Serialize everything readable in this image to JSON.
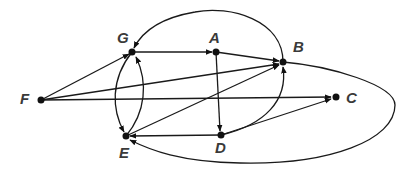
{
  "diagram": {
    "type": "directed-graph",
    "nodes": [
      {
        "id": "A",
        "label": "A",
        "x": 216,
        "y": 52
      },
      {
        "id": "B",
        "label": "B",
        "x": 283,
        "y": 62
      },
      {
        "id": "C",
        "label": "C",
        "x": 336,
        "y": 97
      },
      {
        "id": "D",
        "label": "D",
        "x": 221,
        "y": 135
      },
      {
        "id": "E",
        "label": "E",
        "x": 126,
        "y": 136
      },
      {
        "id": "F",
        "label": "F",
        "x": 41,
        "y": 100
      },
      {
        "id": "G",
        "label": "G",
        "x": 132,
        "y": 52
      }
    ],
    "edges": [
      {
        "from": "F",
        "to": "G"
      },
      {
        "from": "F",
        "to": "B"
      },
      {
        "from": "F",
        "to": "C"
      },
      {
        "from": "G",
        "to": "A"
      },
      {
        "from": "G",
        "to": "E"
      },
      {
        "from": "E",
        "to": "G"
      },
      {
        "from": "A",
        "to": "B"
      },
      {
        "from": "A",
        "to": "D"
      },
      {
        "from": "B",
        "to": "G"
      },
      {
        "from": "B",
        "to": "E"
      },
      {
        "from": "E",
        "to": "B"
      },
      {
        "from": "D",
        "to": "B"
      },
      {
        "from": "D",
        "to": "C"
      },
      {
        "from": "D",
        "to": "E"
      }
    ]
  }
}
